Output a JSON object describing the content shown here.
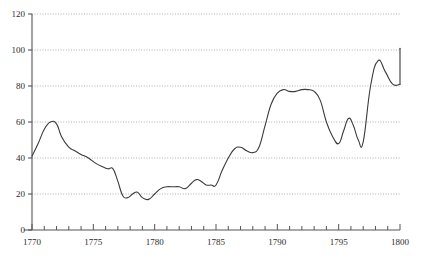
{
  "chart_data": {
    "type": "line",
    "title": "",
    "subtitle": "",
    "xlabel": "",
    "ylabel": "",
    "xlim": [
      1770,
      1800
    ],
    "ylim": [
      0,
      120
    ],
    "yticks": [
      0,
      20,
      40,
      60,
      80,
      100,
      120
    ],
    "ytick_labels": [
      "0",
      "20",
      "40",
      "60",
      "80",
      "100",
      "120"
    ],
    "xticks": [
      1770,
      1775,
      1780,
      1785,
      1790,
      1795,
      1800
    ],
    "xtick_labels": [
      "1770",
      "1775",
      "1780",
      "1785",
      "1790",
      "1795",
      "1800"
    ],
    "x_minor_tick_step": 1,
    "grid": true,
    "grid_axis": "y",
    "grid_style": "dotted",
    "legend": false,
    "legend_position": "none",
    "line_color": "#3a3a3a",
    "grid_color": "#9a9a9a",
    "axis_color": "#555555",
    "background_color": "#ffffff",
    "series": [
      {
        "name": "series-1",
        "x": [
          1770.0,
          1770.5,
          1771.0,
          1771.5,
          1772.0,
          1772.4,
          1773.0,
          1773.5,
          1774.0,
          1774.6,
          1775.2,
          1775.8,
          1776.2,
          1776.6,
          1777.0,
          1777.4,
          1777.8,
          1778.2,
          1778.6,
          1779.0,
          1779.5,
          1780.0,
          1780.5,
          1781.0,
          1781.5,
          1782.0,
          1782.5,
          1783.0,
          1783.4,
          1783.8,
          1784.2,
          1784.6,
          1785.0,
          1785.5,
          1786.0,
          1786.5,
          1787.0,
          1787.5,
          1788.0,
          1788.5,
          1789.0,
          1789.5,
          1790.0,
          1790.5,
          1791.0,
          1791.5,
          1792.0,
          1792.5,
          1793.0,
          1793.5,
          1794.0,
          1794.5,
          1795.0,
          1795.4,
          1795.8,
          1796.2,
          1796.6,
          1797.0,
          1797.6,
          1798.2,
          1798.8,
          1799.4,
          1800.0
        ],
        "y": [
          41,
          48,
          56,
          60,
          59,
          52,
          46,
          44,
          42,
          40,
          37,
          35,
          34,
          34,
          27,
          19,
          18,
          20,
          21,
          18,
          17,
          20,
          23,
          24,
          24,
          24,
          23,
          26,
          28,
          27,
          25,
          25,
          25,
          33,
          40,
          45,
          46,
          44,
          43,
          46,
          58,
          70,
          76,
          78,
          77,
          77,
          78,
          78,
          77,
          72,
          60,
          52,
          48,
          55,
          62,
          58,
          50,
          49,
          80,
          94,
          88,
          81,
          81
        ],
        "start_value": 41,
        "end_value": 101,
        "min_value": 17,
        "max_value": 101
      }
    ],
    "annotations": []
  },
  "plot_geometry": {
    "left_px": 32,
    "right_px": 400,
    "top_px": 14,
    "bottom_px": 230
  }
}
